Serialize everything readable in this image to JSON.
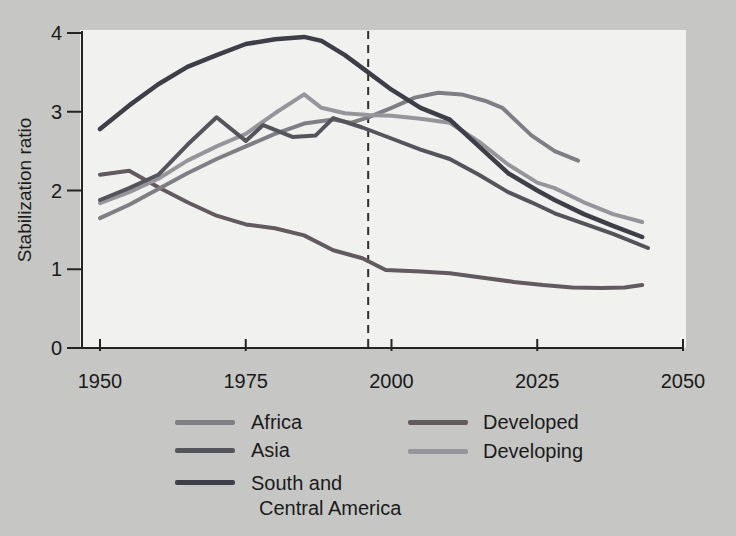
{
  "chart_data": {
    "type": "line",
    "title": "",
    "xlabel": "",
    "ylabel": "Stabilization ratio",
    "xlim": [
      1950,
      2050
    ],
    "ylim": [
      0,
      4
    ],
    "x_ticks": [
      1950,
      1975,
      2000,
      2025,
      2050
    ],
    "y_ticks": [
      0,
      1,
      2,
      3,
      4
    ],
    "grid": false,
    "legend_position": "bottom",
    "reference_line": {
      "x": 1996,
      "style": "dashed",
      "color": "#2e2e2e"
    },
    "series": [
      {
        "name": "Africa",
        "color": "#7e7e84",
        "points": [
          [
            1950,
            1.65
          ],
          [
            1955,
            1.82
          ],
          [
            1960,
            2.02
          ],
          [
            1965,
            2.22
          ],
          [
            1970,
            2.4
          ],
          [
            1975,
            2.56
          ],
          [
            1980,
            2.72
          ],
          [
            1985,
            2.85
          ],
          [
            1990,
            2.9
          ],
          [
            1993,
            2.86
          ],
          [
            1996,
            2.93
          ],
          [
            2000,
            3.05
          ],
          [
            2004,
            3.18
          ],
          [
            2008,
            3.24
          ],
          [
            2012,
            3.22
          ],
          [
            2016,
            3.14
          ],
          [
            2019,
            3.05
          ],
          [
            2024,
            2.7
          ],
          [
            2028,
            2.5
          ],
          [
            2032,
            2.38
          ]
        ]
      },
      {
        "name": "Asia",
        "color": "#54545c",
        "points": [
          [
            1950,
            1.88
          ],
          [
            1955,
            2.03
          ],
          [
            1960,
            2.2
          ],
          [
            1965,
            2.58
          ],
          [
            1970,
            2.93
          ],
          [
            1975,
            2.63
          ],
          [
            1978,
            2.83
          ],
          [
            1983,
            2.68
          ],
          [
            1987,
            2.7
          ],
          [
            1990,
            2.92
          ],
          [
            1995,
            2.8
          ],
          [
            2000,
            2.66
          ],
          [
            2005,
            2.52
          ],
          [
            2010,
            2.4
          ],
          [
            2015,
            2.2
          ],
          [
            2020,
            1.98
          ],
          [
            2024,
            1.85
          ],
          [
            2028,
            1.71
          ],
          [
            2033,
            1.58
          ],
          [
            2038,
            1.45
          ],
          [
            2044,
            1.27
          ]
        ]
      },
      {
        "name": "South and Central America",
        "color": "#3d3e47",
        "points": [
          [
            1950,
            2.78
          ],
          [
            1955,
            3.08
          ],
          [
            1960,
            3.35
          ],
          [
            1965,
            3.57
          ],
          [
            1970,
            3.72
          ],
          [
            1975,
            3.86
          ],
          [
            1980,
            3.92
          ],
          [
            1985,
            3.95
          ],
          [
            1988,
            3.9
          ],
          [
            1992,
            3.72
          ],
          [
            1996,
            3.5
          ],
          [
            2000,
            3.28
          ],
          [
            2005,
            3.05
          ],
          [
            2010,
            2.9
          ],
          [
            2015,
            2.56
          ],
          [
            2020,
            2.22
          ],
          [
            2025,
            2.0
          ],
          [
            2028,
            1.88
          ],
          [
            2033,
            1.7
          ],
          [
            2038,
            1.55
          ],
          [
            2043,
            1.41
          ]
        ]
      },
      {
        "name": "Developed",
        "color": "#625a5f",
        "points": [
          [
            1950,
            2.2
          ],
          [
            1955,
            2.25
          ],
          [
            1960,
            2.04
          ],
          [
            1965,
            1.85
          ],
          [
            1970,
            1.68
          ],
          [
            1975,
            1.57
          ],
          [
            1980,
            1.52
          ],
          [
            1985,
            1.43
          ],
          [
            1990,
            1.24
          ],
          [
            1995,
            1.14
          ],
          [
            1999,
            0.99
          ],
          [
            2005,
            0.97
          ],
          [
            2010,
            0.95
          ],
          [
            2016,
            0.89
          ],
          [
            2021,
            0.84
          ],
          [
            2026,
            0.8
          ],
          [
            2031,
            0.77
          ],
          [
            2036,
            0.76
          ],
          [
            2040,
            0.77
          ],
          [
            2043,
            0.8
          ]
        ]
      },
      {
        "name": "Developing",
        "color": "#95959b",
        "points": [
          [
            1950,
            1.84
          ],
          [
            1955,
            1.98
          ],
          [
            1960,
            2.15
          ],
          [
            1965,
            2.38
          ],
          [
            1970,
            2.56
          ],
          [
            1975,
            2.72
          ],
          [
            1980,
            2.98
          ],
          [
            1985,
            3.22
          ],
          [
            1988,
            3.05
          ],
          [
            1992,
            2.98
          ],
          [
            1996,
            2.96
          ],
          [
            2000,
            2.95
          ],
          [
            2005,
            2.91
          ],
          [
            2010,
            2.86
          ],
          [
            2015,
            2.62
          ],
          [
            2020,
            2.33
          ],
          [
            2025,
            2.1
          ],
          [
            2028,
            2.03
          ],
          [
            2033,
            1.85
          ],
          [
            2038,
            1.7
          ],
          [
            2043,
            1.6
          ]
        ]
      }
    ]
  },
  "legend": {
    "col1": [
      {
        "line1": "Africa",
        "line2": ""
      },
      {
        "line1": "Asia",
        "line2": ""
      },
      {
        "line1": "South and",
        "line2": "Central America"
      }
    ],
    "col2": [
      {
        "line1": "Developed",
        "line2": ""
      },
      {
        "line1": "Developing",
        "line2": ""
      }
    ]
  }
}
